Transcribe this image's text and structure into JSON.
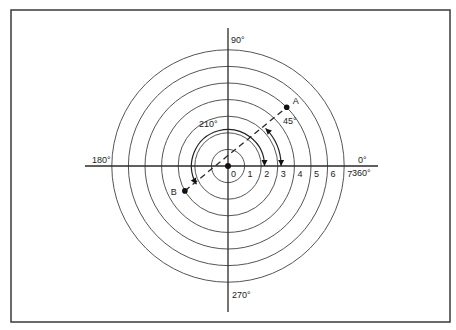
{
  "figure": {
    "frame": {
      "x": 11,
      "y": 10,
      "width": 439,
      "height": 312
    },
    "colors": {
      "ink": "#2a2a2a",
      "circle": "#555555",
      "background": "#ffffff"
    },
    "polar": {
      "center": {
        "x": 228,
        "y": 166
      },
      "unit_px": 16.6,
      "rings": [
        1,
        2,
        3,
        4,
        5,
        6,
        7
      ]
    },
    "axis_labels": {
      "deg_0": "0°",
      "deg_360": "360°",
      "deg_90": "90°",
      "deg_180": "180°",
      "deg_270": "270°"
    },
    "radial_tick_labels": [
      "0",
      "1",
      "2",
      "3",
      "4",
      "5",
      "6",
      "7"
    ],
    "points": [
      {
        "label": "A",
        "r": 5,
        "theta_deg": 45
      },
      {
        "label": "B",
        "r": 3,
        "theta_deg": 210
      }
    ],
    "angle_arcs": [
      {
        "label": "45°",
        "r": 3.2,
        "from_deg": 0,
        "to_deg": 45
      },
      {
        "label": "210°",
        "r": 2.2,
        "from_deg": 0,
        "to_deg": 210
      }
    ]
  }
}
